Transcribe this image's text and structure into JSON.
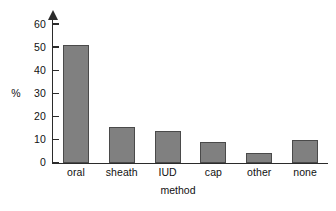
{
  "chart_data": {
    "type": "bar",
    "title": "",
    "subtitle": "",
    "xlabel": "method",
    "ylabel": "%",
    "categories": [
      "oral",
      "sheath",
      "IUD",
      "cap",
      "other",
      "none"
    ],
    "values": [
      51,
      15.5,
      14,
      9,
      4.5,
      10
    ],
    "series": [
      {
        "name": "percentage",
        "values": [
          51,
          15.5,
          14,
          9,
          4.5,
          10
        ]
      }
    ],
    "ylim": [
      0,
      63
    ],
    "yticks": [
      0,
      10,
      20,
      30,
      40,
      50,
      60
    ],
    "ytick_labels": [
      "0",
      "10",
      "20",
      "30",
      "40",
      "50",
      "60"
    ],
    "grid": false,
    "legend": false,
    "legend_position": "none",
    "bar_color": "#808080",
    "bar_edge_color": "#4a4a4a",
    "axis_color": "#2b2b2b",
    "background_color": "#ffffff",
    "annotations": []
  }
}
